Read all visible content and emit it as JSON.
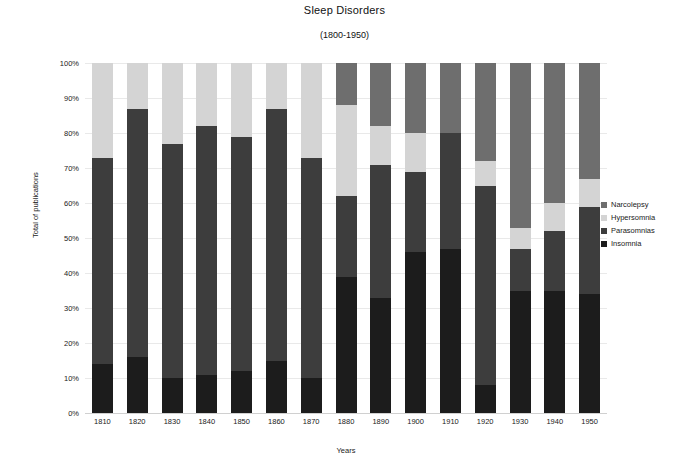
{
  "chart_data": {
    "type": "bar",
    "stacked": true,
    "normalized": true,
    "title": "Sleep Disorders",
    "subtitle": "(1800-1950)",
    "xlabel": "Years",
    "ylabel": "Total of publications",
    "ylim": [
      0,
      100
    ],
    "ytick_labels": [
      "100%",
      "90%",
      "80%",
      "70%",
      "60%",
      "50%",
      "40%",
      "30%",
      "20%",
      "10%",
      "0%"
    ],
    "ytick_values": [
      100,
      90,
      80,
      70,
      60,
      50,
      40,
      30,
      20,
      10,
      0
    ],
    "grid": true,
    "legend_position": "right",
    "categories": [
      "1810",
      "1820",
      "1830",
      "1840",
      "1850",
      "1860",
      "1870",
      "1880",
      "1890",
      "1900",
      "1910",
      "1920",
      "1930",
      "1940",
      "1950"
    ],
    "series": [
      {
        "name": "Insomnia",
        "color": "#1c1c1c",
        "values": [
          14,
          16,
          10,
          11,
          12,
          15,
          10,
          39,
          33,
          46,
          47,
          8,
          35,
          35,
          34
        ]
      },
      {
        "name": "Parasomnias",
        "color": "#3d3d3d",
        "values": [
          59,
          71,
          67,
          71,
          67,
          72,
          63,
          23,
          38,
          23,
          33,
          57,
          12,
          17,
          25
        ]
      },
      {
        "name": "Hypersomnia",
        "color": "#d4d4d4",
        "values": [
          27,
          13,
          23,
          18,
          21,
          13,
          27,
          26,
          11,
          11,
          0,
          7,
          6,
          8,
          8
        ]
      },
      {
        "name": "Narcolepsy",
        "color": "#6e6e6e",
        "values": [
          0,
          0,
          0,
          0,
          0,
          0,
          0,
          12,
          18,
          20,
          20,
          28,
          47,
          40,
          33
        ]
      }
    ],
    "stack_order_bottom_to_top": [
      "Insomnia",
      "Parasomnias",
      "Hypersomnia",
      "Narcolepsy"
    ]
  },
  "legend": {
    "items": [
      {
        "label": "Narcolepsy",
        "color": "#6e6e6e"
      },
      {
        "label": "Hypersomnia",
        "color": "#d4d4d4"
      },
      {
        "label": "Parasomnias",
        "color": "#3d3d3d"
      },
      {
        "label": "Insomnia",
        "color": "#1c1c1c"
      }
    ]
  }
}
